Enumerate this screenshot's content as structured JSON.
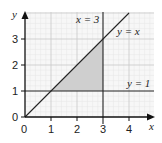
{
  "diagram": {
    "x_axis_label": "x",
    "y_axis_label": "y",
    "x_ticks": [
      "0",
      "1",
      "2",
      "3",
      "4"
    ],
    "y_ticks": [
      "0",
      "1",
      "2",
      "3"
    ],
    "lines": [
      {
        "label": "x = 3"
      },
      {
        "label": "y = x"
      },
      {
        "label": "y = 1"
      }
    ],
    "shaded_region": "triangle bounded by y = x, x = 3, y = 1 with vertices (1,1), (3,1), (3,3)",
    "colors": {
      "grid": "#dcdcdc",
      "shade": "#cfcfcf",
      "line": "#222222"
    }
  }
}
